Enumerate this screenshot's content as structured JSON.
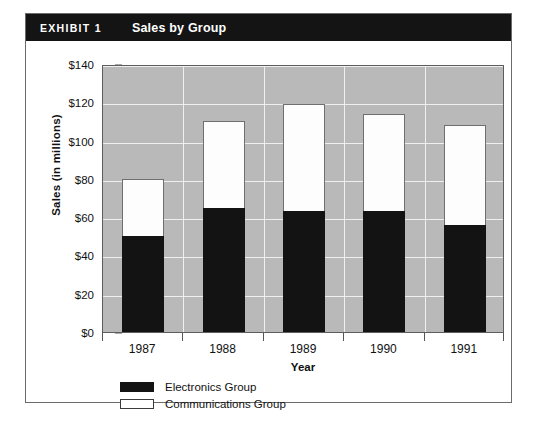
{
  "exhibit": {
    "number": "EXHIBIT 1",
    "title": "Sales by Group"
  },
  "chart_data": {
    "type": "bar",
    "subtype": "stacked",
    "title": "Sales by Group",
    "xlabel": "Year",
    "ylabel": "Sales (in millions)",
    "categories": [
      "1987",
      "1988",
      "1989",
      "1990",
      "1991"
    ],
    "ylim": [
      0,
      140
    ],
    "ytick_values": [
      0,
      20,
      40,
      60,
      80,
      100,
      120,
      140
    ],
    "ytick_labels": [
      "$0",
      "$20",
      "$40",
      "$60",
      "$80",
      "$100",
      "$120",
      "$140"
    ],
    "grid": true,
    "legend_position": "bottom-left",
    "plot_background": "#b9b9b9",
    "series": [
      {
        "name": "Electronics Group",
        "color": "#131313",
        "values": [
          50,
          65,
          63,
          63,
          56
        ]
      },
      {
        "name": "Communications Group",
        "color": "#ffffff",
        "values": [
          30,
          45,
          56,
          51,
          52
        ]
      }
    ],
    "totals": [
      80,
      110,
      119,
      114,
      108
    ]
  }
}
